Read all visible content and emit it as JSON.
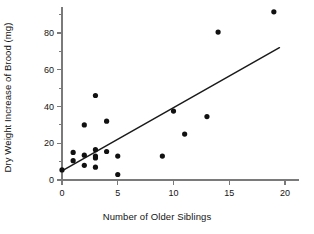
{
  "chart_data": {
    "type": "scatter",
    "title": "",
    "xlabel": "Number of Older Siblings",
    "ylabel": "Dry Weight Increase of Brood (mg)",
    "xlim": [
      -1.2,
      21.5
    ],
    "ylim": [
      -3,
      96
    ],
    "grid": false,
    "legend": "none",
    "x_ticks": [
      0,
      5,
      10,
      15,
      20
    ],
    "x_tick_labels": [
      "0",
      "5",
      "10",
      "15",
      "20"
    ],
    "x_minor_ticks": [],
    "y_ticks": [
      0,
      20,
      40,
      60,
      80
    ],
    "y_tick_labels": [
      "0",
      "20",
      "40",
      "60",
      "80"
    ],
    "y_minor_ticks": [
      10,
      30,
      50,
      70,
      90
    ],
    "marker_color": "#111111",
    "line_color": "#1a1a1a",
    "axis_color": "#7a7a7a",
    "points": [
      {
        "x": 0,
        "y": 5.5
      },
      {
        "x": 1,
        "y": 15.0
      },
      {
        "x": 1,
        "y": 10.5
      },
      {
        "x": 2,
        "y": 30.0
      },
      {
        "x": 2,
        "y": 13.5
      },
      {
        "x": 2,
        "y": 8.0
      },
      {
        "x": 3,
        "y": 46.0
      },
      {
        "x": 3,
        "y": 16.5
      },
      {
        "x": 3,
        "y": 13.0
      },
      {
        "x": 3,
        "y": 12.0
      },
      {
        "x": 3,
        "y": 7.0
      },
      {
        "x": 4,
        "y": 32.0
      },
      {
        "x": 4,
        "y": 15.5
      },
      {
        "x": 5,
        "y": 13.0
      },
      {
        "x": 5,
        "y": 3.0
      },
      {
        "x": 9,
        "y": 13.0
      },
      {
        "x": 10,
        "y": 37.5
      },
      {
        "x": 11,
        "y": 25.0
      },
      {
        "x": 13,
        "y": 34.5
      },
      {
        "x": 14,
        "y": 80.5
      },
      {
        "x": 19,
        "y": 91.5
      }
    ],
    "trendline": {
      "x_start": 0,
      "y_start": 5.0,
      "x_end": 19.5,
      "y_end": 72.0
    }
  }
}
